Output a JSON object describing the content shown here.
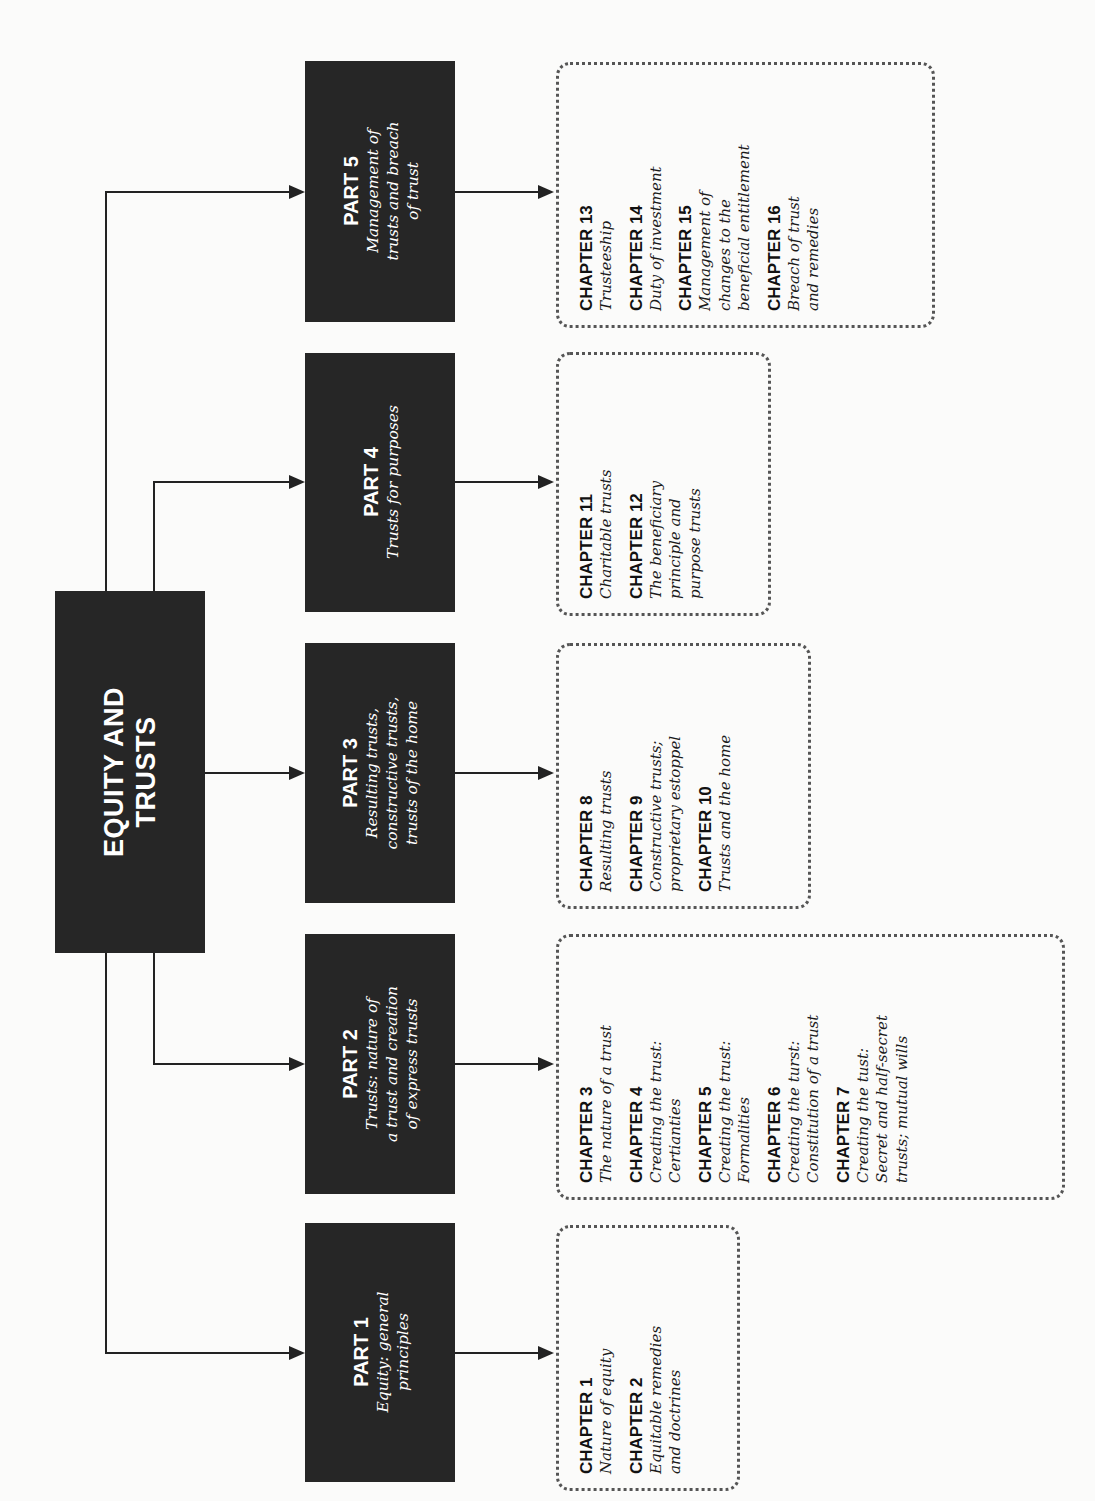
{
  "root": {
    "title_line1": "EQUITY AND",
    "title_line2": "TRUSTS"
  },
  "parts": [
    {
      "label": "PART 1",
      "desc": [
        "Equity: general",
        "principles"
      ]
    },
    {
      "label": "PART 2",
      "desc": [
        "Trusts: nature of",
        "a trust and creation",
        "of express trusts"
      ]
    },
    {
      "label": "PART 3",
      "desc": [
        "Resulting trusts,",
        "constructive trusts,",
        "trusts  of the home"
      ]
    },
    {
      "label": "PART 4",
      "desc": [
        "Trusts for purposes"
      ]
    },
    {
      "label": "PART 5",
      "desc": [
        "Management of",
        "trusts and breach",
        "of trust"
      ]
    }
  ],
  "chapter_groups": [
    {
      "part": "PART 1",
      "chapters": [
        {
          "num": "CHAPTER 1",
          "title": "Nature of equity"
        },
        {
          "num": "CHAPTER 2",
          "title": "Equitable remedies\nand doctrines"
        }
      ]
    },
    {
      "part": "PART 2",
      "chapters": [
        {
          "num": "CHAPTER 3",
          "title": "The nature of a trust"
        },
        {
          "num": "CHAPTER 4",
          "title": "Creating the trust:\nCertianties"
        },
        {
          "num": "CHAPTER 5",
          "title": "Creating the trust:\nFormalities"
        },
        {
          "num": "CHAPTER 6",
          "title": "Creating the turst:\nConstitution of a trust"
        },
        {
          "num": "CHAPTER 7",
          "title": "Creating the tust:\nSecret and half-secret\ntrusts; mutual wills"
        }
      ]
    },
    {
      "part": "PART 3",
      "chapters": [
        {
          "num": "CHAPTER 8",
          "title": "Resulting trusts"
        },
        {
          "num": "CHAPTER 9",
          "title": "Constructive trusts;\nproprietary estoppel"
        },
        {
          "num": "CHAPTER 10",
          "title": "Trusts and the home"
        }
      ]
    },
    {
      "part": "PART 4",
      "chapters": [
        {
          "num": "CHAPTER 11",
          "title": "Charitable trusts"
        },
        {
          "num": "CHAPTER 12",
          "title": "The beneficiary\nprinciple and\npurpose trusts"
        }
      ]
    },
    {
      "part": "PART 5",
      "chapters": [
        {
          "num": "CHAPTER 13",
          "title": "Trusteeship"
        },
        {
          "num": "CHAPTER 14",
          "title": "Duty of investment"
        },
        {
          "num": "CHAPTER 15",
          "title": "Management of\nchanges to the\nbeneficial entitlement"
        },
        {
          "num": "CHAPTER 16",
          "title": "Breach of trust\nand remedies"
        }
      ]
    }
  ],
  "colors": {
    "box_fill": "#262626",
    "box_text": "#ffffff",
    "line": "#222222",
    "dotted_border": "#555555",
    "background": "#fbfbfa"
  }
}
